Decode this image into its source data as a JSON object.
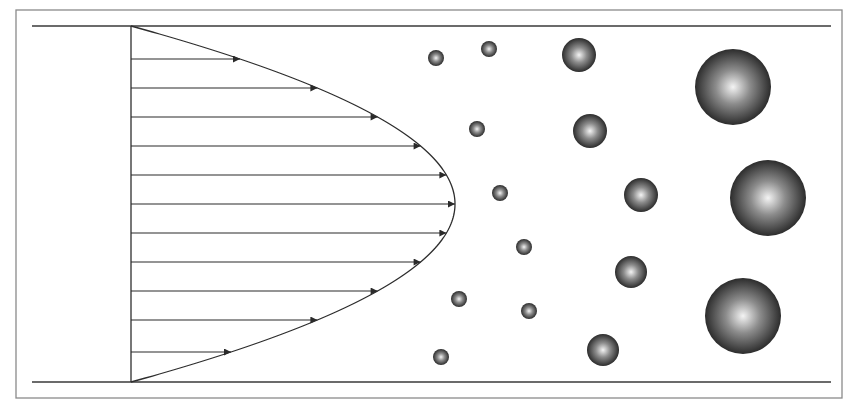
{
  "diagram": {
    "title": "",
    "colors": {
      "background": "#ffffff",
      "frame": "#8a8a8a",
      "wall": "#3a3a3a",
      "profile_line": "#2e2e2e",
      "arrow": "#2a2a2a",
      "sphere_highlight": "#f4f4f4",
      "sphere_mid": "#8c8c8c",
      "sphere_edge": "#2c2c2c"
    },
    "frame": {
      "x": 16,
      "y": 10,
      "width": 826,
      "height": 388
    },
    "channel": {
      "x_start": 32,
      "x_end": 831,
      "top_wall_y": 26,
      "bottom_wall_y": 382
    },
    "velocity_profile": {
      "type": "parabolic",
      "base_x": 131,
      "top_y": 26,
      "bottom_y": 382,
      "vertex_x": 455,
      "vertex_y": 204,
      "arrow_rows_y": [
        59,
        88,
        117,
        146,
        175,
        204,
        233,
        262,
        291,
        320,
        352
      ]
    },
    "particles": {
      "small": [
        {
          "cx": 436,
          "cy": 58,
          "r": 8
        },
        {
          "cx": 489,
          "cy": 49,
          "r": 8
        },
        {
          "cx": 477,
          "cy": 129,
          "r": 8
        },
        {
          "cx": 500,
          "cy": 193,
          "r": 8
        },
        {
          "cx": 524,
          "cy": 247,
          "r": 8
        },
        {
          "cx": 459,
          "cy": 299,
          "r": 8
        },
        {
          "cx": 529,
          "cy": 311,
          "r": 8
        },
        {
          "cx": 441,
          "cy": 357,
          "r": 8
        }
      ],
      "medium": [
        {
          "cx": 579,
          "cy": 55,
          "r": 17
        },
        {
          "cx": 590,
          "cy": 131,
          "r": 17
        },
        {
          "cx": 641,
          "cy": 195,
          "r": 17
        },
        {
          "cx": 631,
          "cy": 272,
          "r": 16
        },
        {
          "cx": 603,
          "cy": 350,
          "r": 16
        }
      ],
      "large": [
        {
          "cx": 733,
          "cy": 87,
          "r": 38
        },
        {
          "cx": 768,
          "cy": 198,
          "r": 38
        },
        {
          "cx": 743,
          "cy": 316,
          "r": 38
        }
      ]
    }
  }
}
